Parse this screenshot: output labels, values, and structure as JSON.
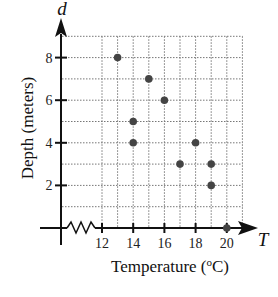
{
  "chart_data": {
    "type": "scatter",
    "title": "",
    "xlabel": "Temperature (°C)",
    "ylabel": "Depth (meters)",
    "x_variable": "T",
    "y_variable": "d",
    "x_ticks": [
      12,
      14,
      16,
      18,
      20
    ],
    "y_ticks": [
      2,
      4,
      6,
      8
    ],
    "xlim": [
      12,
      21
    ],
    "ylim": [
      0,
      9
    ],
    "x_axis_break": true,
    "grid": true,
    "grid_step": 1,
    "legend": null,
    "points": [
      {
        "x": 13,
        "y": 8
      },
      {
        "x": 15,
        "y": 7
      },
      {
        "x": 16,
        "y": 6
      },
      {
        "x": 14,
        "y": 5
      },
      {
        "x": 14,
        "y": 4
      },
      {
        "x": 18,
        "y": 4
      },
      {
        "x": 17,
        "y": 3
      },
      {
        "x": 19,
        "y": 3
      },
      {
        "x": 19,
        "y": 2
      },
      {
        "x": 20,
        "y": 0
      }
    ],
    "point_color": "#444444"
  },
  "labels": {
    "y_var": "d",
    "x_var": "T",
    "y_title": "Depth (meters)",
    "x_title_main": "Temperature (",
    "x_title_deg": "o",
    "x_title_unit": "C)"
  }
}
